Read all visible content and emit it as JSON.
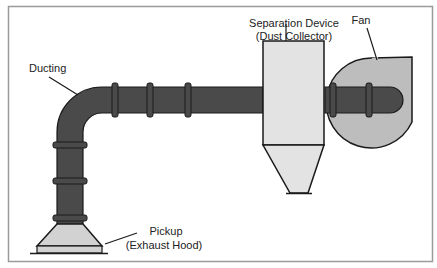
{
  "diagram": {
    "type": "dust-collection-system",
    "colors": {
      "frame": "#9a9a9a",
      "duct_fill": "#4a4a4a",
      "outline": "#1a1a1a",
      "collector_fill": "#e3e3e3",
      "fan_fill": "#bdbdbd",
      "hood_fill": "#d2d2d2",
      "background": "#ffffff"
    },
    "labels": {
      "ducting": "Ducting",
      "separation_line1": "Separation Device",
      "separation_line2": "(Dust Collector)",
      "fan": "Fan",
      "pickup_line1": "Pickup",
      "pickup_line2": "(Exhaust Hood)"
    },
    "components": [
      {
        "id": "pickup",
        "name": "Pickup (Exhaust Hood)"
      },
      {
        "id": "ducting",
        "name": "Ducting"
      },
      {
        "id": "separation-device",
        "name": "Separation Device (Dust Collector)"
      },
      {
        "id": "fan",
        "name": "Fan"
      }
    ]
  }
}
